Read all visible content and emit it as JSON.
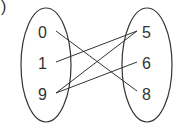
{
  "fragment": ")",
  "domain_set": {
    "elements": [
      "0",
      "1",
      "9"
    ]
  },
  "range_set": {
    "elements": [
      "5",
      "6",
      "8"
    ]
  },
  "mappings": [
    {
      "from": "0",
      "to": "8"
    },
    {
      "from": "1",
      "to": "5"
    },
    {
      "from": "9",
      "to": "5"
    },
    {
      "from": "9",
      "to": "6"
    }
  ],
  "colors": {
    "stroke": "#333333",
    "background": "#ffffff"
  }
}
